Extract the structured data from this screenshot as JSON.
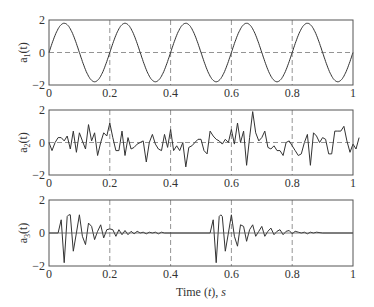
{
  "chart_data": [
    {
      "type": "line",
      "title": "",
      "ylabel": "a1(t)",
      "ylabel_base": "a",
      "ylabel_sub": "1",
      "ylabel_tail": "(t)",
      "xlabel": "",
      "xlim": [
        0,
        1
      ],
      "ylim": [
        -2,
        2
      ],
      "xticks": [
        "0",
        "0.2",
        "0.4",
        "0.6",
        "0.8",
        "1"
      ],
      "yticks": [
        "2",
        "0",
        "−2"
      ],
      "grid": {
        "vertical_dashed_at": [
          0.2,
          0.4,
          0.6,
          0.8
        ],
        "horizontal_dashed_at": [
          0
        ]
      },
      "series": [
        {
          "name": "a1",
          "formula": "1.8*sin(2*pi*5*t)",
          "amplitude": 1.8,
          "frequency_hz": 5
        }
      ]
    },
    {
      "type": "line",
      "title": "",
      "ylabel": "a2(t)",
      "ylabel_base": "a",
      "ylabel_sub": "2",
      "ylabel_tail": "(t)",
      "xlabel": "",
      "xlim": [
        0,
        1
      ],
      "ylim": [
        -2,
        2
      ],
      "xticks": [
        "0",
        "0.2",
        "0.4",
        "0.6",
        "0.8",
        "1"
      ],
      "yticks": [
        "2",
        "0",
        "−2"
      ],
      "grid": {
        "vertical_dashed_at": [
          0.2,
          0.4,
          0.6,
          0.8
        ],
        "horizontal_dashed_at": [
          0
        ]
      },
      "series": [
        {
          "name": "a2",
          "x_step": 0.01,
          "values": [
            0.0,
            -0.5,
            0.0,
            0.3,
            0.3,
            0.1,
            0.4,
            -0.4,
            0.7,
            -0.6,
            0.6,
            0.1,
            -0.4,
            1.1,
            0.1,
            0.6,
            -0.8,
            0.0,
            0.6,
            0.4,
            1.2,
            0.3,
            -0.5,
            -0.5,
            0.7,
            -0.8,
            0.3,
            -0.4,
            -0.3,
            -0.1,
            0.0,
            0.1,
            -1.2,
            0.0,
            0.5,
            -0.1,
            -0.4,
            -0.5,
            0.5,
            -0.3,
            0.8,
            -0.5,
            -0.2,
            -0.5,
            0.0,
            -1.5,
            -0.3,
            -0.2,
            0.0,
            0.2,
            0.2,
            -0.5,
            -0.7,
            0.7,
            0.4,
            0.2,
            0.1,
            -0.1,
            0.2,
            0.0,
            0.8,
            -0.1,
            1.2,
            0.0,
            0.7,
            -1.4,
            0.3,
            1.9,
            0.6,
            0.1,
            0.3,
            0.7,
            -0.3,
            -0.4,
            -0.2,
            -0.5,
            -0.5,
            -0.8,
            0.0,
            0.1,
            -0.2,
            -0.5,
            -0.8,
            -0.7,
            0.0,
            0.5,
            -1.4,
            0.6,
            0.4,
            0.0,
            0.3,
            0.2,
            -0.7,
            -0.7,
            0.7,
            0.7,
            0.7,
            1.0,
            0.1,
            -0.6,
            -0.1,
            -0.4,
            0.3
          ]
        }
      ]
    },
    {
      "type": "line",
      "title": "",
      "ylabel": "a3(t)",
      "ylabel_base": "a",
      "ylabel_sub": "3",
      "ylabel_tail": "(t)",
      "xlabel": "Time (t), s",
      "xlim": [
        0,
        1
      ],
      "ylim": [
        -2,
        2
      ],
      "xticks": [
        "0",
        "0.2",
        "0.4",
        "0.6",
        "0.8",
        "1"
      ],
      "yticks": [
        "2",
        "0",
        "−2"
      ],
      "grid": {
        "vertical_dashed_at": [
          0.2,
          0.4,
          0.6,
          0.8
        ],
        "horizontal_dashed_at": []
      },
      "series": [
        {
          "name": "a3",
          "description": "two decaying oscillation bursts starting near t=0.03 and t=0.53",
          "x": [
            0,
            0.03,
            0.04,
            0.05,
            0.06,
            0.065,
            0.07,
            0.08,
            0.09,
            0.1,
            0.11,
            0.12,
            0.13,
            0.14,
            0.15,
            0.16,
            0.17,
            0.18,
            0.19,
            0.2,
            0.21,
            0.22,
            0.23,
            0.24,
            0.25,
            0.26,
            0.27,
            0.28,
            0.29,
            0.3,
            0.31,
            0.32,
            0.33,
            0.34,
            0.35,
            0.36,
            0.37,
            0.38,
            0.4,
            0.53,
            0.54,
            0.55,
            0.56,
            0.565,
            0.57,
            0.58,
            0.59,
            0.6,
            0.61,
            0.62,
            0.63,
            0.64,
            0.65,
            0.66,
            0.67,
            0.68,
            0.69,
            0.7,
            0.71,
            0.72,
            0.73,
            0.74,
            0.75,
            0.76,
            0.77,
            0.78,
            0.79,
            0.8,
            0.81,
            0.82,
            0.83,
            0.84,
            0.85,
            0.86,
            0.87,
            0.88,
            0.9,
            1.0
          ],
          "values": [
            0,
            0,
            0.8,
            -1.8,
            1.0,
            1.1,
            1.1,
            -1.1,
            0.0,
            1.1,
            -0.2,
            -0.7,
            0.6,
            0.4,
            -0.4,
            0.1,
            0.5,
            -0.3,
            0.2,
            0.25,
            0.2,
            -0.2,
            0.2,
            -0.1,
            0.15,
            -0.1,
            0.1,
            -0.05,
            0.1,
            0.0,
            0.05,
            -0.05,
            0.05,
            0.0,
            0.05,
            -0.05,
            0.05,
            0.0,
            0.0,
            0,
            0.8,
            -1.8,
            1.0,
            1.1,
            1.0,
            -1.1,
            0.0,
            1.1,
            -0.2,
            -0.8,
            0.5,
            0.4,
            -0.5,
            0.2,
            0.5,
            -0.2,
            0.1,
            0.4,
            -0.2,
            0.1,
            0.3,
            -0.1,
            0.1,
            0.2,
            -0.1,
            0.1,
            0.15,
            -0.05,
            0.1,
            0.05,
            0.0,
            0.05,
            -0.05,
            0.05,
            0.0,
            0.05,
            0.0,
            0.0
          ]
        }
      ]
    }
  ]
}
